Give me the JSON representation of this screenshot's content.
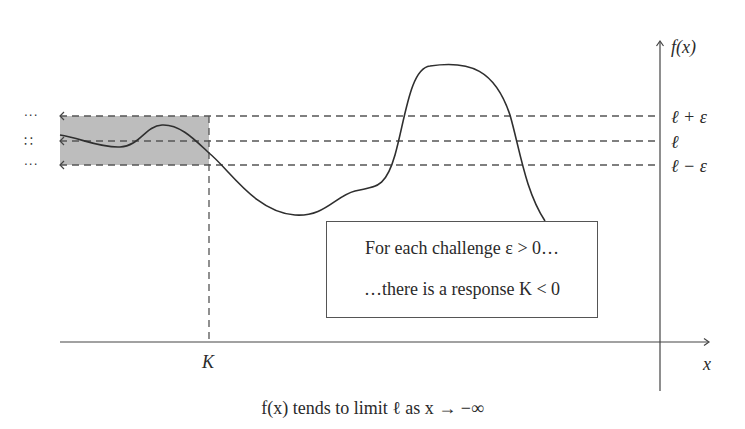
{
  "diagram": {
    "axes": {
      "y_axis_label": "f(x)",
      "x_axis_label": "x"
    },
    "levels": {
      "upper": "ℓ + ε",
      "middle": "ℓ",
      "lower": "ℓ − ε"
    },
    "k_marker": "K",
    "left_dots": {
      "upper": "···",
      "middle": "∷",
      "lower": "···"
    },
    "callout": {
      "line1": "For each challenge ε > 0…",
      "line2": "…there is a response K < 0"
    },
    "caption": "f(x) tends to limit ℓ as x → −∞",
    "colors": {
      "shaded_band": "#b8b8b8",
      "curve": "#2f2f2f",
      "dashed": "#555555",
      "axis": "#444444"
    }
  }
}
